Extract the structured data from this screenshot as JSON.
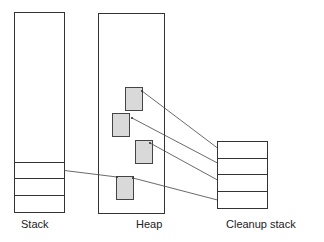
{
  "diagram": {
    "labels": {
      "stack": "Stack",
      "heap": "Heap",
      "cleanup": "Cleanup stack"
    },
    "colors": {
      "stroke": "#333333",
      "block_fill": "#d9d9d9",
      "background": "#ffffff"
    },
    "stack": {
      "slots": 3
    },
    "cleanup_stack": {
      "slots": 4
    },
    "heap_blocks": 4
  }
}
